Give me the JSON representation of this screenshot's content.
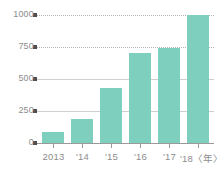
{
  "chart_data": {
    "type": "bar",
    "title": "",
    "subtitle": "",
    "xlabel": "年",
    "ylabel": "",
    "categories": [
      "2013",
      "'14",
      "'15",
      "'16",
      "'17",
      "'18"
    ],
    "tick_labels_x": [
      "2013",
      "'14",
      "'15",
      "'16",
      "'17",
      "'18〈年〉"
    ],
    "values": [
      85,
      190,
      430,
      700,
      740,
      1000
    ],
    "ylim": [
      0,
      1000
    ],
    "yticks": [
      0,
      250,
      500,
      750,
      1000
    ],
    "ytick_labels": [
      "0",
      "250",
      "500",
      "750",
      "1000"
    ],
    "grid": true,
    "grid_axis": "y",
    "legend": null,
    "legend_position": "none",
    "series": [
      {
        "name": "",
        "values": [
          85,
          190,
          430,
          700,
          740,
          1000
        ]
      }
    ],
    "colors": {
      "bar": "#7ecfbd",
      "axis": "#9a9a9a",
      "gridline": "#b4b4b4",
      "tick_marker": "#4f4f4f",
      "label_text": "#8d8d8d",
      "background": "#ffffff"
    },
    "annotations": [],
    "axis_unit_note": "〈年〉"
  }
}
